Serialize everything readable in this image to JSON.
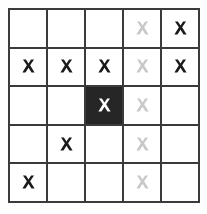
{
  "diagram": {
    "rows": 5,
    "cols": 5,
    "colors": {
      "grid_line": "#3b3b3b",
      "cell_background": "#ffffff",
      "highlight_cell_background": "#262626",
      "mark_dark": "#1a1a1a",
      "mark_light": "#c8c8c8",
      "mark_on_highlight": "#ffffff",
      "page_background": "#fefefe"
    },
    "legend": [
      {
        "key": "dark",
        "label": "dark X mark"
      },
      {
        "key": "light",
        "label": "light gray X mark"
      },
      {
        "key": "white",
        "label": "white X mark on filled cell"
      },
      {
        "key": "none",
        "label": "empty cell"
      }
    ],
    "cells": [
      [
        {
          "mark": "none",
          "filled": false,
          "name": "cell-r1c1"
        },
        {
          "mark": "none",
          "filled": false,
          "name": "cell-r1c2"
        },
        {
          "mark": "none",
          "filled": false,
          "name": "cell-r1c3"
        },
        {
          "mark": "light",
          "filled": false,
          "name": "cell-r1c4"
        },
        {
          "mark": "dark",
          "filled": false,
          "name": "cell-r1c5"
        }
      ],
      [
        {
          "mark": "dark",
          "filled": false,
          "name": "cell-r2c1"
        },
        {
          "mark": "dark",
          "filled": false,
          "name": "cell-r2c2"
        },
        {
          "mark": "dark",
          "filled": false,
          "name": "cell-r2c3"
        },
        {
          "mark": "light",
          "filled": false,
          "name": "cell-r2c4"
        },
        {
          "mark": "dark",
          "filled": false,
          "name": "cell-r2c5"
        }
      ],
      [
        {
          "mark": "none",
          "filled": false,
          "name": "cell-r3c1"
        },
        {
          "mark": "none",
          "filled": false,
          "name": "cell-r3c2"
        },
        {
          "mark": "white",
          "filled": true,
          "name": "cell-r3c3"
        },
        {
          "mark": "light",
          "filled": false,
          "name": "cell-r3c4"
        },
        {
          "mark": "none",
          "filled": false,
          "name": "cell-r3c5"
        }
      ],
      [
        {
          "mark": "none",
          "filled": false,
          "name": "cell-r4c1"
        },
        {
          "mark": "dark",
          "filled": false,
          "name": "cell-r4c2"
        },
        {
          "mark": "none",
          "filled": false,
          "name": "cell-r4c3"
        },
        {
          "mark": "light",
          "filled": false,
          "name": "cell-r4c4"
        },
        {
          "mark": "none",
          "filled": false,
          "name": "cell-r4c5"
        }
      ],
      [
        {
          "mark": "dark",
          "filled": false,
          "name": "cell-r5c1"
        },
        {
          "mark": "none",
          "filled": false,
          "name": "cell-r5c2"
        },
        {
          "mark": "none",
          "filled": false,
          "name": "cell-r5c3"
        },
        {
          "mark": "light",
          "filled": false,
          "name": "cell-r5c4"
        },
        {
          "mark": "none",
          "filled": false,
          "name": "cell-r5c5"
        }
      ]
    ]
  }
}
